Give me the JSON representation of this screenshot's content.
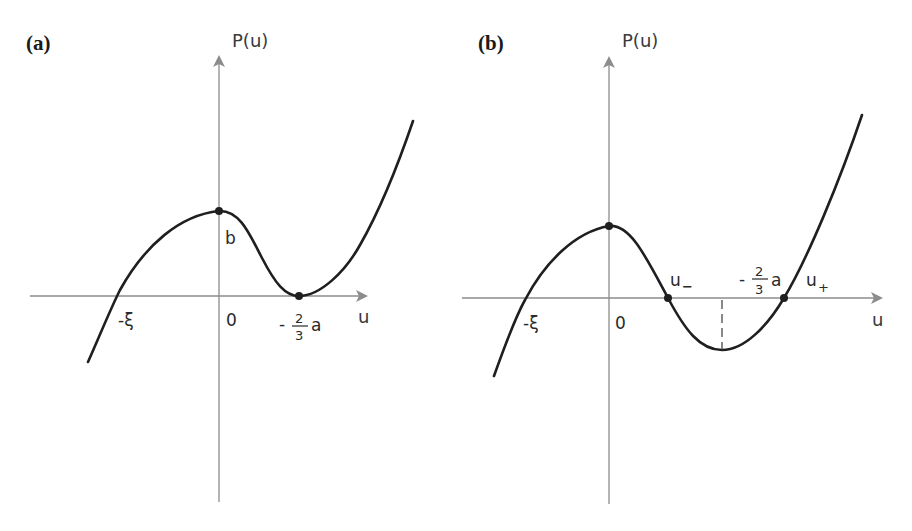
{
  "panels": [
    {
      "label": "(a)",
      "y_axis_label": "P(u)",
      "x_axis_label": "u",
      "tick_labels": {
        "neg_xi": "-ξ",
        "zero": "0",
        "b": "b",
        "minus_sign": "-",
        "frac_num": "2",
        "frac_den": "3",
        "a": "a"
      },
      "description": "Cubic P(u) with local maximum b at u=0 and double root (touching u-axis) at u=-2a/3; single root at -ξ"
    },
    {
      "label": "(b)",
      "y_axis_label": "P(u)",
      "x_axis_label": "u",
      "tick_labels": {
        "neg_xi": "-ξ",
        "zero": "0",
        "u_minus": "u",
        "u_minus_sub": "−",
        "u_plus": "u",
        "u_plus_sub": "+",
        "minus_sign": "-",
        "frac_num": "2",
        "frac_den": "3",
        "a": "a"
      },
      "description": "Cubic P(u) with three real roots -ξ, u−, u+; local minimum at u=-2a/3 below axis (dashed marker)"
    }
  ],
  "colors": {
    "axis": "#8c8c8c",
    "curve": "#1f1f1f",
    "background": "#ffffff"
  }
}
